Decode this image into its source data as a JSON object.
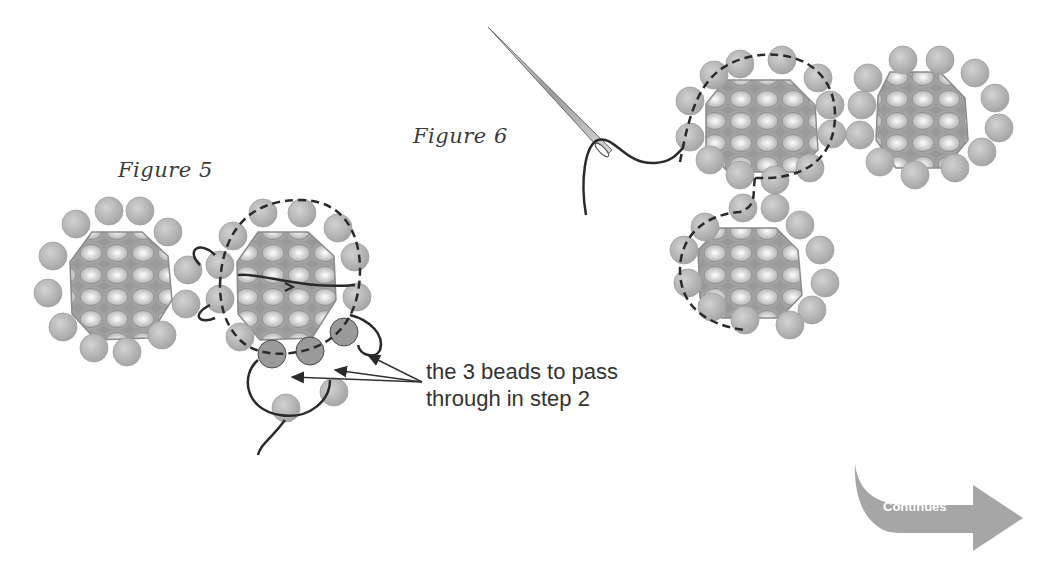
{
  "figures": [
    {
      "id": "figure-5",
      "label": "Figure 5"
    },
    {
      "id": "figure-6",
      "label": "Figure 6"
    }
  ],
  "callout": {
    "line1": "the 3 beads to pass",
    "line2": "through in step 2"
  },
  "continue_button": {
    "label": "Continues"
  },
  "colors": {
    "bead": "#b8b8b8",
    "rivoli": "#a9a9a9",
    "thread": "#2a2a2a",
    "arrow": "#9a9a9a"
  }
}
